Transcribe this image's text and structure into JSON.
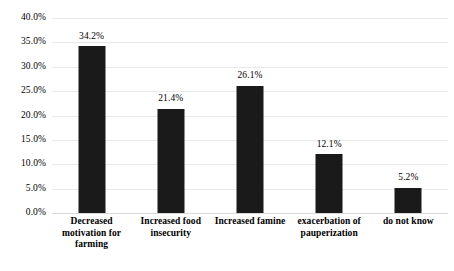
{
  "chart_data": {
    "type": "bar",
    "title": "",
    "subtitle": "",
    "xlabel": "",
    "ylabel": "",
    "categories": [
      "Decreased motivation for farming",
      "Increased food insecurity",
      "Increased famine",
      "exacerbation of pauperization",
      "do not know"
    ],
    "values": [
      34.2,
      21.4,
      26.1,
      12.1,
      5.2
    ],
    "data_labels": [
      "34.2%",
      "21.4%",
      "26.1%",
      "12.1%",
      "5.2%"
    ],
    "ylim": [
      0,
      40
    ],
    "ytick_values": [
      0,
      5,
      10,
      15,
      20,
      25,
      30,
      35,
      40
    ],
    "ytick_labels": [
      "0.0%",
      "5.0%",
      "10.0%",
      "15.0%",
      "20.0%",
      "25.0%",
      "30.0%",
      "35.0%",
      "40.0%"
    ],
    "grid": true,
    "legend": false,
    "legend_position": "none",
    "colors": {
      "bar": "#1a1a1a",
      "grid": "#e9e9e9",
      "baseline": "#d9d9d9",
      "text": "#000000",
      "background": "#ffffff"
    }
  }
}
